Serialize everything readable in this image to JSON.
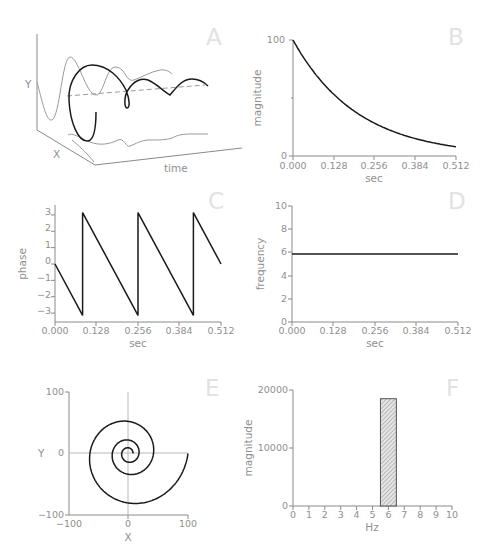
{
  "panels": {
    "A": {
      "letter": "A",
      "ylabel": "Y",
      "xlabel": "X",
      "tlabel": "time"
    },
    "B": {
      "letter": "B",
      "ylabel": "magnitude",
      "xlabel": "sec",
      "yticks": [
        "0",
        "100"
      ],
      "xticks": [
        "0.000",
        "0.128",
        "0.256",
        "0.384",
        "0.512"
      ]
    },
    "C": {
      "letter": "C",
      "ylabel": "phase",
      "xlabel": "sec",
      "yticks": [
        "3",
        "2",
        "1",
        "0",
        "−1",
        "−2",
        "−3"
      ],
      "xticks": [
        "0.000",
        "0.128",
        "0.256",
        "0.384",
        "0.512"
      ]
    },
    "D": {
      "letter": "D",
      "ylabel": "frequency",
      "xlabel": "sec",
      "yticks": [
        "0",
        "2",
        "4",
        "6",
        "8",
        "10"
      ],
      "xticks": [
        "0.000",
        "0.128",
        "0.256",
        "0.384",
        "0.512"
      ]
    },
    "E": {
      "letter": "E",
      "ylabel": "Y",
      "xlabel": "X",
      "yticks": [
        "100",
        "0",
        "−100"
      ],
      "xticks": [
        "−100",
        "0",
        "100"
      ]
    },
    "F": {
      "letter": "F",
      "ylabel": "magnitude",
      "xlabel": "Hz",
      "yticks": [
        "0",
        "10000",
        "20000"
      ],
      "xticks": [
        "0",
        "1",
        "2",
        "3",
        "4",
        "5",
        "6",
        "7",
        "8",
        "9",
        "10"
      ]
    }
  },
  "chart_data": [
    {
      "panel": "A",
      "type": "line",
      "title": "A",
      "description": "3D view of a complex exponential (helix) along time axis with its X and Y projections and dashed center axis",
      "axis_labels": {
        "y": "Y",
        "x": "X",
        "t": "time"
      }
    },
    {
      "panel": "B",
      "type": "line",
      "title": "B",
      "xlabel": "sec",
      "ylabel": "magnitude",
      "xlim": [
        0,
        0.512
      ],
      "ylim": [
        0,
        100
      ],
      "x": [
        0.0,
        0.064,
        0.128,
        0.192,
        0.256,
        0.32,
        0.384,
        0.448,
        0.512
      ],
      "values": [
        100,
        73,
        53,
        39,
        28,
        21,
        15,
        11,
        8
      ]
    },
    {
      "panel": "C",
      "type": "line",
      "title": "C",
      "xlabel": "sec",
      "ylabel": "phase",
      "xlim": [
        0,
        0.512
      ],
      "ylim": [
        -3.5,
        3.5
      ],
      "x": [
        0.0,
        0.085,
        0.085,
        0.256,
        0.256,
        0.427,
        0.427,
        0.512
      ],
      "values": [
        0,
        -3.14,
        3.14,
        -3.14,
        3.14,
        -3.14,
        3.14,
        0
      ]
    },
    {
      "panel": "D",
      "type": "line",
      "title": "D",
      "xlabel": "sec",
      "ylabel": "frequency",
      "xlim": [
        0,
        0.512
      ],
      "ylim": [
        0,
        10
      ],
      "x": [
        0.0,
        0.512
      ],
      "values": [
        5.86,
        5.86
      ]
    },
    {
      "panel": "E",
      "type": "line",
      "title": "E",
      "xlabel": "X",
      "ylabel": "Y",
      "xlim": [
        -100,
        100
      ],
      "ylim": [
        -100,
        100
      ],
      "description": "Decaying spiral starting at (100, 0), rotating clockwise inward toward origin",
      "start_radius": 100,
      "decay_per_turn": 0.42,
      "turns": 3
    },
    {
      "panel": "F",
      "type": "bar",
      "title": "F",
      "xlabel": "Hz",
      "ylabel": "magnitude",
      "xlim": [
        0,
        10
      ],
      "ylim": [
        0,
        20000
      ],
      "categories": [
        "6"
      ],
      "bar_range": [
        5.5,
        6.5
      ],
      "values": [
        18500
      ]
    }
  ]
}
